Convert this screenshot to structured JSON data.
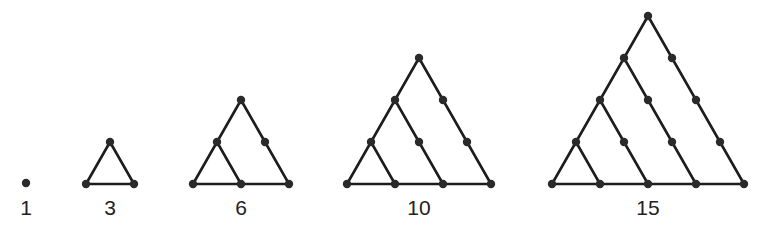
{
  "colors": {
    "line": "#1c1c1c",
    "dot": "#2a2a2a",
    "label": "#222222",
    "background": "#ffffff"
  },
  "figures": [
    {
      "label": "1",
      "rows": 1,
      "apex": [
        26,
        183
      ],
      "label_pos": [
        26,
        215
      ]
    },
    {
      "label": "3",
      "rows": 2,
      "apex": [
        110,
        142
      ],
      "label_pos": [
        110,
        215
      ]
    },
    {
      "label": "6",
      "rows": 3,
      "apex": [
        241,
        100
      ],
      "label_pos": [
        241,
        215
      ]
    },
    {
      "label": "10",
      "rows": 4,
      "apex": [
        419,
        58
      ],
      "label_pos": [
        419,
        215
      ]
    },
    {
      "label": "15",
      "rows": 5,
      "apex": [
        648,
        16
      ],
      "label_pos": [
        648,
        215
      ]
    }
  ],
  "geometry": {
    "half_step_x": 24,
    "step_y": 42,
    "dot_radius": 4.2
  }
}
